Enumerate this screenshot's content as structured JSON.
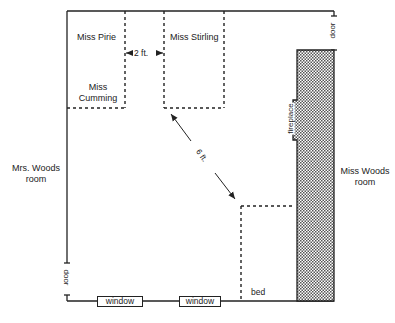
{
  "diagram": {
    "type": "floor-plan",
    "rooms": {
      "left_adjacent": {
        "line1": "Mrs. Woods",
        "line2": "room"
      },
      "right_adjacent": {
        "line1": "Miss Woods",
        "line2": "room"
      }
    },
    "occupants": {
      "pirie": "Miss Pirie",
      "cumming_line1": "Miss",
      "cumming_line2": "Cumming",
      "stirling": "Miss Stirling"
    },
    "measurements": {
      "gap": "2 ft.",
      "diagonal": "6 ft."
    },
    "fixtures": {
      "door_top_right": "door",
      "door_bottom_left": "door",
      "fireplace": "fireplace",
      "window_1": "window",
      "window_2": "window",
      "bed": "bed"
    },
    "colors": {
      "line": "#222222",
      "fireplace_fill": "#bdbdbd",
      "background": "#ffffff"
    }
  }
}
